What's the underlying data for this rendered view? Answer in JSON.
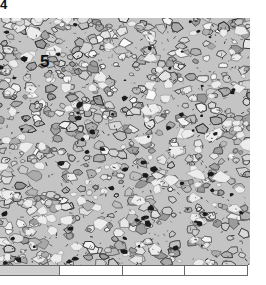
{
  "figure": {
    "panel_label": "4",
    "region_label": "5",
    "micrograph": {
      "description": "grayscale granular mineral texture",
      "base_color": "#c4c4c4",
      "dark_grain_color": "#1a1a1a",
      "light_grain_color": "#ececec"
    },
    "scale_bar": {
      "segments": [
        {
          "width": 60,
          "fill": "#cfcfcf"
        },
        {
          "width": 63,
          "fill": "#ffffff"
        },
        {
          "width": 62,
          "fill": "#ffffff"
        },
        {
          "width": 63,
          "fill": "#ffffff"
        }
      ]
    }
  }
}
